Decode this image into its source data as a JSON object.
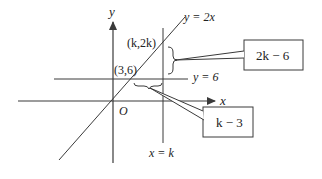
{
  "diagram": {
    "axes": {
      "x_label": "x",
      "y_label": "y",
      "origin_label": "O"
    },
    "lines": {
      "diagonal_label": "y = 2x",
      "horizontal_label": "y = 6",
      "vertical_label": "x = k"
    },
    "points": {
      "upper_point_label": "(k,2k)",
      "intersection_point_label": "(3,6)"
    },
    "callouts": {
      "vertical_gap_label": "2k − 6",
      "horizontal_gap_label": "k − 3"
    },
    "colors": {
      "stroke": "#3a3a3a",
      "text": "#222222",
      "background": "#ffffff"
    }
  }
}
